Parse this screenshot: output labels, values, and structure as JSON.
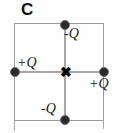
{
  "figure": {
    "panel_label": "C",
    "center_marker": "✖",
    "colors": {
      "square_line": "#9a9a9a",
      "axis_line": "#a6a6a6",
      "charge_fill": "#2b2b2b",
      "text": "#1b1b1b",
      "background": "#fefefe"
    },
    "charges": [
      {
        "id": "top",
        "label": "-Q",
        "sign": "negative",
        "position": "top-edge-midpoint"
      },
      {
        "id": "left",
        "label": "+Q",
        "sign": "positive",
        "position": "left-edge-midpoint"
      },
      {
        "id": "right",
        "label": "+Q",
        "sign": "positive",
        "position": "right-edge-midpoint"
      },
      {
        "id": "bottom",
        "label": "-Q",
        "sign": "negative",
        "position": "bottom-edge-midpoint"
      }
    ]
  }
}
